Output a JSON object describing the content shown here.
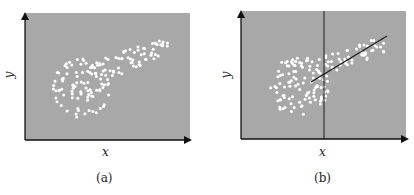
{
  "panels": [
    {
      "id": "a",
      "caption": "(a)",
      "xlabel": "x",
      "ylabel": "y",
      "has_vertical_line": false,
      "has_slanted_line": false
    },
    {
      "id": "b",
      "caption": "(b)",
      "xlabel": "x",
      "ylabel": "y",
      "has_vertical_line": true,
      "has_slanted_line": true
    }
  ],
  "colors": {
    "plot_bg": "#a8a8a8",
    "points": "#ffffff",
    "axes": "#111111",
    "lines": "#1a1a1a"
  },
  "seed": 7,
  "n_points": 150
}
